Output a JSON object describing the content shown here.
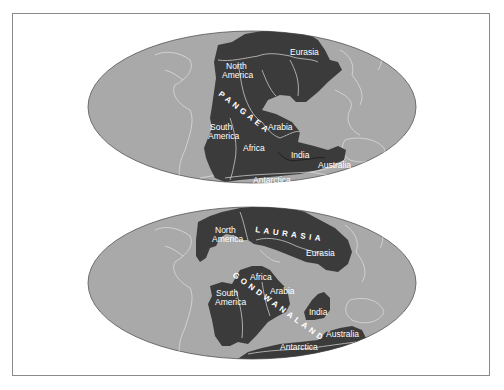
{
  "colors": {
    "ocean": "#a9a9a9",
    "land": "#3b3b3b",
    "outline": "#e4e4e4",
    "frame": "#8a8a8a",
    "label": "#ffffff"
  },
  "maps": [
    {
      "name": "pangaea",
      "supercontinent": "PANGAEA",
      "labels": {
        "north_america_1": "North",
        "north_america_2": "America",
        "eurasia": "Eurasia",
        "south_america_1": "South",
        "south_america_2": "America",
        "africa": "Africa",
        "arabia": "Arabia",
        "india": "India",
        "australia": "Australia",
        "antarctica": "Antarctica"
      }
    },
    {
      "name": "laurasia-gondwanaland",
      "northern_supercontinent": "LAURASIA",
      "southern_supercontinent": "GONDWANALAND",
      "labels": {
        "north_america_1": "North",
        "north_america_2": "America",
        "eurasia": "Eurasia",
        "africa": "Africa",
        "arabia": "Arabia",
        "south_america_1": "South",
        "south_america_2": "America",
        "india": "India",
        "australia": "Australia",
        "antarctica": "Antarctica"
      }
    }
  ]
}
